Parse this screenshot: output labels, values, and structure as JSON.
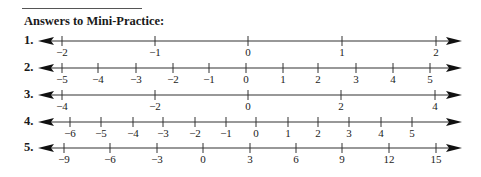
{
  "heading": {
    "title": "Answers to Mini-Practice:"
  },
  "number_lines": [
    {
      "label": "1.",
      "y": 41,
      "ticks": [
        {
          "v": "−2",
          "x": 62
        },
        {
          "v": "−1",
          "x": 155
        },
        {
          "v": "0",
          "x": 248
        },
        {
          "v": "1",
          "x": 342
        },
        {
          "v": "2",
          "x": 436
        }
      ]
    },
    {
      "label": "2.",
      "y": 68,
      "ticks": [
        {
          "v": "−5",
          "x": 62
        },
        {
          "v": "−4",
          "x": 98
        },
        {
          "v": "−3",
          "x": 136
        },
        {
          "v": "−2",
          "x": 173
        },
        {
          "v": "−1",
          "x": 209
        },
        {
          "v": "0",
          "x": 246
        },
        {
          "v": "1",
          "x": 283
        },
        {
          "v": "2",
          "x": 318
        },
        {
          "v": "3",
          "x": 356
        },
        {
          "v": "4",
          "x": 393
        },
        {
          "v": "5",
          "x": 430
        }
      ]
    },
    {
      "label": "3.",
      "y": 95,
      "ticks": [
        {
          "v": "−4",
          "x": 62
        },
        {
          "v": "−2",
          "x": 155
        },
        {
          "v": "0",
          "x": 248
        },
        {
          "v": "2",
          "x": 341
        },
        {
          "v": "4",
          "x": 435
        }
      ]
    },
    {
      "label": "4.",
      "y": 122,
      "ticks": [
        {
          "v": "−6",
          "x": 70
        },
        {
          "v": "−5",
          "x": 101
        },
        {
          "v": "−4",
          "x": 133
        },
        {
          "v": "−3",
          "x": 163
        },
        {
          "v": "−2",
          "x": 195
        },
        {
          "v": "−1",
          "x": 226
        },
        {
          "v": "0",
          "x": 256
        },
        {
          "v": "1",
          "x": 288
        },
        {
          "v": "2",
          "x": 318
        },
        {
          "v": "3",
          "x": 349
        },
        {
          "v": "4",
          "x": 381
        },
        {
          "v": "5",
          "x": 412
        }
      ]
    },
    {
      "label": "5.",
      "y": 148,
      "ticks": [
        {
          "v": "−9",
          "x": 64
        },
        {
          "v": "−6",
          "x": 110
        },
        {
          "v": "−3",
          "x": 157
        },
        {
          "v": "0",
          "x": 203
        },
        {
          "v": "3",
          "x": 250
        },
        {
          "v": "6",
          "x": 296
        },
        {
          "v": "9",
          "x": 342
        },
        {
          "v": "12",
          "x": 389
        },
        {
          "v": "15",
          "x": 436
        }
      ]
    }
  ]
}
